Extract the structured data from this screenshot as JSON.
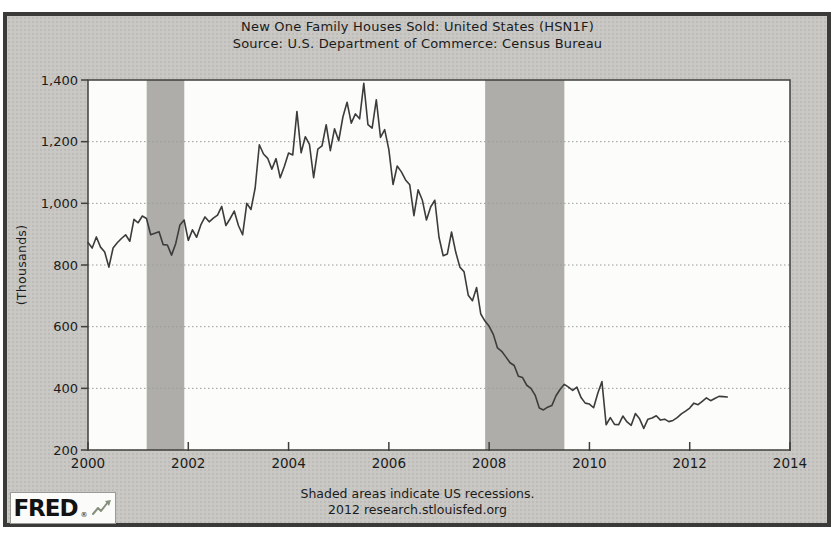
{
  "header": {
    "title": "New One Family Houses Sold: United States (HSN1F)",
    "source": "Source: U.S. Department of Commerce: Census Bureau"
  },
  "y_axis": {
    "title": "(Thousands)"
  },
  "footer": {
    "note": "Shaded areas indicate US recessions.",
    "attribution": "2012 research.stlouisfed.org",
    "logo_text": "FRED",
    "logo_reg": "®"
  },
  "colors": {
    "frame_border": "#3a3a38",
    "canvas_bg": "#c9c8c4",
    "plot_bg": "#fcfcfa",
    "recession_band": "#aeada9",
    "gridline": "#9b9b98",
    "axis": "#3f3f3d",
    "line": "#3c3c3c",
    "text": "#1b1b1b"
  },
  "chart_data": {
    "type": "line",
    "title": "New One Family Houses Sold: United States (HSN1F)",
    "subtitle": "Source: U.S. Department of Commerce: Census Bureau",
    "xlabel": "",
    "ylabel": "(Thousands)",
    "xlim": [
      2000,
      2014
    ],
    "ylim": [
      200,
      1400
    ],
    "x_ticks": [
      2000,
      2002,
      2004,
      2006,
      2008,
      2010,
      2012,
      2014
    ],
    "y_ticks": [
      {
        "value": 1400,
        "label": "1,400"
      },
      {
        "value": 1200,
        "label": "1,200"
      },
      {
        "value": 1000,
        "label": "1,000"
      },
      {
        "value": 800,
        "label": "800"
      },
      {
        "value": 600,
        "label": "600"
      },
      {
        "value": 400,
        "label": "400"
      },
      {
        "value": 200,
        "label": "200"
      }
    ],
    "grid": "horizontal-dotted",
    "legend": "none",
    "recessions": [
      [
        2001.17,
        2001.92
      ],
      [
        2007.92,
        2009.5
      ]
    ],
    "x_start_year": 2000,
    "x_interval_months": 1,
    "series": [
      {
        "name": "HSN1F",
        "values": [
          873,
          855,
          891,
          858,
          842,
          793,
          855,
          872,
          886,
          898,
          877,
          948,
          937,
          959,
          951,
          898,
          903,
          908,
          866,
          865,
          832,
          870,
          930,
          946,
          880,
          914,
          890,
          930,
          956,
          940,
          952,
          962,
          990,
          928,
          950,
          975,
          928,
          898,
          1000,
          980,
          1049,
          1190,
          1160,
          1146,
          1111,
          1145,
          1083,
          1120,
          1163,
          1157,
          1298,
          1164,
          1216,
          1191,
          1083,
          1176,
          1186,
          1255,
          1171,
          1242,
          1203,
          1280,
          1328,
          1260,
          1290,
          1274,
          1389,
          1255,
          1244,
          1336,
          1214,
          1239,
          1174,
          1061,
          1121,
          1102,
          1076,
          1060,
          960,
          1044,
          1011,
          946,
          988,
          1010,
          890,
          830,
          836,
          907,
          842,
          793,
          778,
          702,
          684,
          727,
          641,
          618,
          601,
          575,
          531,
          520,
          502,
          483,
          474,
          439,
          435,
          410,
          400,
          378,
          336,
          330,
          339,
          344,
          376,
          397,
          413,
          404,
          393,
          404,
          370,
          352,
          349,
          337,
          384,
          422,
          282,
          305,
          283,
          282,
          310,
          291,
          280,
          318,
          301,
          270,
          300,
          304,
          311,
          297,
          300,
          292,
          296,
          305,
          317,
          326,
          336,
          352,
          347,
          358,
          369,
          360,
          367,
          374,
          373,
          372
        ]
      }
    ],
    "footnote": "Shaded areas indicate US recessions.",
    "attribution": "2012 research.stlouisfed.org"
  }
}
